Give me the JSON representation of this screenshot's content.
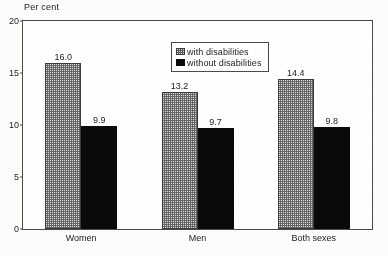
{
  "chart_data": {
    "type": "bar",
    "title": "",
    "subtitle": "",
    "xlabel": "",
    "ylabel": "Per cent",
    "categories": [
      "Women",
      "Men",
      "Both sexes"
    ],
    "series": [
      {
        "name": "with disabilities",
        "values": [
          16.0,
          13.2,
          14.4
        ],
        "labels": [
          "16.0",
          "13.2",
          "14.4"
        ],
        "fill": "checker-gray",
        "color": "#d9d9d9"
      },
      {
        "name": "without disabilities",
        "values": [
          9.9,
          9.7,
          9.8
        ],
        "labels": [
          "9.9",
          "9.7",
          "9.8"
        ],
        "fill": "solid",
        "color": "#0a0a0a"
      }
    ],
    "ylim": [
      0,
      20
    ],
    "yticks": [
      0,
      5,
      10,
      15,
      20
    ],
    "ytick_labels": [
      "0",
      "5",
      "10",
      "15",
      "20"
    ],
    "grid": false,
    "legend_position": "top-right-inside",
    "frame": true
  },
  "axis": {
    "unit_label": "Per cent"
  },
  "legend": {
    "entries": [
      {
        "label": "with disabilities"
      },
      {
        "label": "without disabilities"
      }
    ]
  },
  "colors": {
    "series_with_disabilities": "#d9d9d9",
    "series_without_disabilities": "#0a0a0a",
    "frame": "#4a4a4a",
    "background": "#fdfdfb"
  }
}
